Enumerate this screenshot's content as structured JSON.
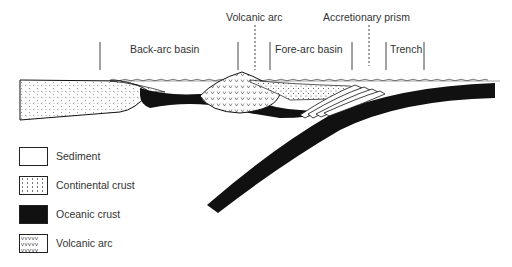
{
  "diagram": {
    "zones": [
      {
        "label": "Back-arc basin"
      },
      {
        "label": "Volcanic arc"
      },
      {
        "label": "Fore-arc basin"
      },
      {
        "label": "Accretionary prism"
      },
      {
        "label": "Trench"
      }
    ],
    "legend": [
      {
        "label": "Sediment",
        "pattern": "fine-dots"
      },
      {
        "label": "Continental crust",
        "pattern": "dashes"
      },
      {
        "label": "Oceanic crust",
        "pattern": "solid-black"
      },
      {
        "label": "Volcanic arc",
        "pattern": "v-marks"
      }
    ],
    "colors": {
      "ink": "#111111",
      "background": "#ffffff"
    }
  }
}
